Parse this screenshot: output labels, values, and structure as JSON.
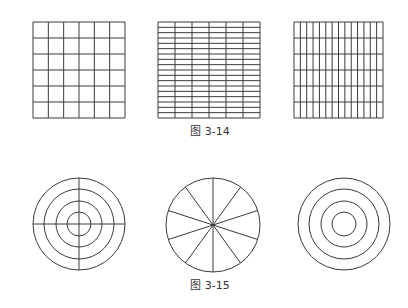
{
  "figures": [
    {
      "caption": "图 3-14",
      "caption_pos": {
        "x": 170,
        "y": 122
      },
      "items": [
        {
          "type": "grid",
          "name": "grid-square-6x6",
          "x": 33,
          "y": 22,
          "w": 92,
          "h": 96,
          "cols": 6,
          "rows": 6
        },
        {
          "type": "grid",
          "name": "grid-horizontal-rows",
          "x": 158,
          "y": 22,
          "w": 102,
          "h": 96,
          "cols": 6,
          "rows": 18
        },
        {
          "type": "grid",
          "name": "grid-vertical-columns",
          "x": 294,
          "y": 22,
          "w": 89,
          "h": 96,
          "cols": 14,
          "rows": 6
        }
      ]
    },
    {
      "caption": "图 3-15",
      "caption_pos": {
        "x": 170,
        "y": 276
      },
      "items": [
        {
          "type": "concentric",
          "name": "target-with-crosshair",
          "cx": 79,
          "cy": 224,
          "radii": [
            46,
            35,
            23,
            12
          ],
          "spokes": 4,
          "spoke_offset_deg": 0
        },
        {
          "type": "concentric",
          "name": "pie-ten-segments",
          "cx": 213,
          "cy": 225,
          "radii": [
            47
          ],
          "spokes": 10,
          "spoke_offset_deg": 90
        },
        {
          "type": "concentric",
          "name": "plain-concentric-rings",
          "cx": 344,
          "cy": 224,
          "radii": [
            46,
            35,
            23,
            12
          ],
          "spokes": 0,
          "spoke_offset_deg": 0
        }
      ]
    }
  ],
  "style": {
    "stroke": "#3a3a3a",
    "stroke_width": 1
  }
}
